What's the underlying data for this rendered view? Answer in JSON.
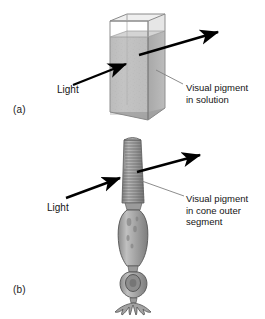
{
  "figure": {
    "panels": [
      {
        "id": "a",
        "label": "(a)",
        "light_label": "Light",
        "pigment_label": "Visual pigment\nin solution",
        "subject": "cuvette-of-pigment-solution"
      },
      {
        "id": "b",
        "label": "(b)",
        "light_label": "Light",
        "pigment_label": "Visual pigment\nin cone outer\nsegment",
        "subject": "cone-photoreceptor-cell"
      }
    ],
    "colors": {
      "background": "#ffffff",
      "ink": "#141414",
      "arrow": "#000000",
      "leader_line": "#7a7a7a",
      "cuvette_glass": "#9a9a9a",
      "solution_fill": "#bdbdbd",
      "solution_shadow": "#a5a5a5",
      "cell_body": "#9d9d9d",
      "cell_outline": "#4a4a4a",
      "outer_segment": "#8f8f8f"
    }
  }
}
